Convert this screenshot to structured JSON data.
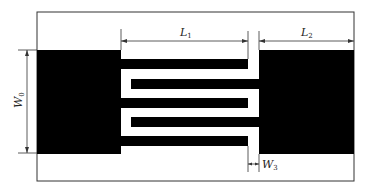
{
  "diagram": {
    "type": "interdigital capacitor layout",
    "colors": {
      "metal": "#000000",
      "substrate": "#ffffff",
      "frame": "#333333",
      "dimension": "#333333"
    },
    "labels": {
      "L1": {
        "main": "L",
        "sub": "1"
      },
      "L2": {
        "main": "L",
        "sub": "2"
      },
      "W0": {
        "main": "W",
        "sub": "0"
      },
      "W3": {
        "main": "W",
        "sub": "3"
      }
    },
    "fingers": {
      "left_count": 3,
      "right_count": 2
    }
  }
}
